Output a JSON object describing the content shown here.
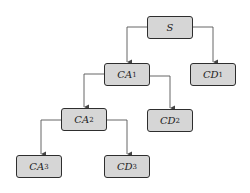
{
  "diagram": {
    "type": "tree",
    "colors": {
      "node_fill": "#d6d6d6",
      "node_border": "#2e2e2e",
      "edge": "#555555",
      "background": "#ffffff"
    },
    "nodes": [
      {
        "id": "S",
        "label": "S",
        "sub": "",
        "x": 147,
        "y": 16
      },
      {
        "id": "CA1",
        "label": "CA",
        "sub": "1",
        "x": 104,
        "y": 63
      },
      {
        "id": "CD1",
        "label": "CD",
        "sub": "1",
        "x": 190,
        "y": 63
      },
      {
        "id": "CA2",
        "label": "CA",
        "sub": "2",
        "x": 61,
        "y": 108
      },
      {
        "id": "CD2",
        "label": "CD",
        "sub": "2",
        "x": 147,
        "y": 109
      },
      {
        "id": "CA3",
        "label": "CA",
        "sub": "3",
        "x": 16,
        "y": 155
      },
      {
        "id": "CD3",
        "label": "CD",
        "sub": "3",
        "x": 104,
        "y": 155
      }
    ],
    "edges": [
      {
        "from": "S",
        "to": "CA1"
      },
      {
        "from": "S",
        "to": "CD1"
      },
      {
        "from": "CA1",
        "to": "CA2"
      },
      {
        "from": "CA1",
        "to": "CD2"
      },
      {
        "from": "CA2",
        "to": "CA3"
      },
      {
        "from": "CA2",
        "to": "CD3"
      }
    ]
  }
}
